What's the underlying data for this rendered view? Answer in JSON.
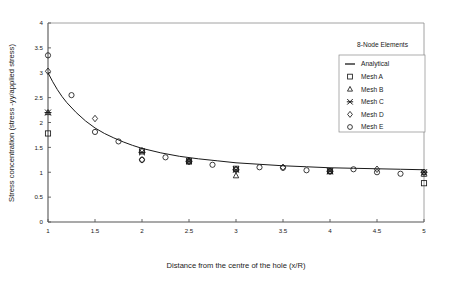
{
  "chart_data": {
    "type": "scatter",
    "title": "",
    "annotation": "8-Node Elements",
    "xlabel": "Distance from the centre of the hole (x/R)",
    "ylabel": "Stress concentration (stress -yy/applied stress)",
    "xlim": [
      1,
      5
    ],
    "ylim": [
      0,
      4
    ],
    "xticks": [
      1,
      1.5,
      2,
      2.5,
      3,
      3.5,
      4,
      4.5,
      5
    ],
    "xtick_labels": [
      "1",
      "1.5",
      "2",
      "2.5",
      "3",
      "3.5",
      "4",
      "4.5",
      "5"
    ],
    "yticks": [
      0,
      0.5,
      1,
      1.5,
      2,
      2.5,
      3,
      3.5,
      4
    ],
    "ytick_labels": [
      "0",
      "0.5",
      "1",
      "1.5",
      "2",
      "2.5",
      "3",
      "3.5",
      "4"
    ],
    "grid": false,
    "legend_position": "top-right",
    "series": [
      {
        "name": "Analytical",
        "marker": "line",
        "x": [
          1.0,
          1.05,
          1.1,
          1.15,
          1.2,
          1.3,
          1.4,
          1.5,
          1.6,
          1.7,
          1.8,
          1.9,
          2.0,
          2.2,
          2.4,
          2.6,
          2.8,
          3.0,
          3.25,
          3.5,
          3.75,
          4.0,
          4.25,
          4.5,
          4.75,
          5.0
        ],
        "y": [
          3.0,
          2.82,
          2.66,
          2.52,
          2.4,
          2.2,
          2.03,
          1.89,
          1.78,
          1.69,
          1.61,
          1.54,
          1.48,
          1.39,
          1.32,
          1.27,
          1.23,
          1.19,
          1.16,
          1.13,
          1.11,
          1.09,
          1.08,
          1.07,
          1.06,
          1.05
        ]
      },
      {
        "name": "Mesh A",
        "marker": "square",
        "x": [
          1.0,
          2.0,
          2.5,
          3.0,
          4.0,
          5.0
        ],
        "y": [
          1.78,
          1.42,
          1.22,
          1.07,
          1.02,
          0.78
        ]
      },
      {
        "name": "Mesh B",
        "marker": "triangle",
        "x": [
          1.0,
          2.0,
          2.5,
          3.0,
          4.0,
          5.0
        ],
        "y": [
          2.2,
          1.44,
          1.23,
          0.93,
          1.02,
          0.96
        ]
      },
      {
        "name": "Mesh C",
        "marker": "asterisk",
        "x": [
          1.0,
          2.0,
          2.5,
          3.0,
          4.0,
          5.0
        ],
        "y": [
          2.2,
          1.4,
          1.22,
          1.05,
          1.02,
          1.0
        ]
      },
      {
        "name": "Mesh D",
        "marker": "diamond",
        "x": [
          1.0,
          1.5,
          2.0,
          2.5,
          3.0,
          3.5,
          4.0,
          4.5,
          5.0
        ],
        "y": [
          3.03,
          2.08,
          1.25,
          1.22,
          1.06,
          1.1,
          1.02,
          1.06,
          1.0
        ]
      },
      {
        "name": "Mesh E",
        "marker": "circle",
        "x": [
          1.0,
          1.25,
          1.5,
          1.75,
          2.0,
          2.25,
          2.5,
          2.75,
          3.0,
          3.25,
          3.5,
          3.75,
          4.0,
          4.25,
          4.5,
          4.75,
          5.0
        ],
        "y": [
          3.35,
          2.55,
          1.81,
          1.62,
          1.25,
          1.3,
          1.21,
          1.15,
          1.05,
          1.1,
          1.09,
          1.04,
          1.02,
          1.06,
          1.0,
          0.97,
          1.0
        ]
      }
    ],
    "legend_entries": [
      {
        "label": "Analytical",
        "marker": "line"
      },
      {
        "label": "Mesh A",
        "marker": "square"
      },
      {
        "label": "Mesh B",
        "marker": "triangle"
      },
      {
        "label": "Mesh C",
        "marker": "asterisk"
      },
      {
        "label": "Mesh D",
        "marker": "diamond"
      },
      {
        "label": "Mesh E",
        "marker": "circle"
      }
    ],
    "colors": {
      "axis": "#555555",
      "series": "#1a1a1a",
      "background": "#ffffff",
      "plot_border": "#8a8a8a"
    }
  }
}
